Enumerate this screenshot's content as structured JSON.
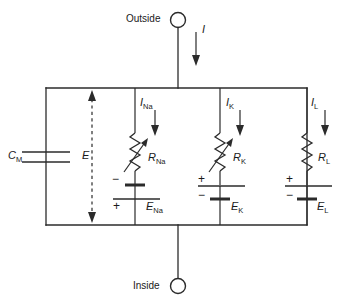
{
  "figure": {
    "title_outside": "Outside",
    "title_inside": "Inside",
    "type": "electrical-circuit-schematic"
  },
  "terminals": {
    "outside": {
      "label": "Outside",
      "icon": "circle-terminal"
    },
    "inside": {
      "label": "Inside",
      "icon": "circle-terminal"
    }
  },
  "currents": {
    "total": {
      "symbol": "I",
      "sub": ""
    },
    "sodium": {
      "symbol": "I",
      "sub": "Na"
    },
    "potassium": {
      "symbol": "I",
      "sub": "K"
    },
    "leak": {
      "symbol": "I",
      "sub": "L"
    }
  },
  "membrane_potential": {
    "symbol": "E",
    "sub": "",
    "arrow": "double-headed-dashed"
  },
  "capacitor": {
    "symbol": "C",
    "sub": "M",
    "name": "membrane-capacitance"
  },
  "branches": [
    {
      "name": "sodium-branch",
      "current": {
        "symbol": "I",
        "sub": "Na"
      },
      "resistor": {
        "symbol": "R",
        "sub": "Na",
        "variable": true
      },
      "battery": {
        "symbol": "E",
        "sub": "Na",
        "top_sign": "−",
        "bottom_sign": "+"
      }
    },
    {
      "name": "potassium-branch",
      "current": {
        "symbol": "I",
        "sub": "K"
      },
      "resistor": {
        "symbol": "R",
        "sub": "K",
        "variable": true
      },
      "battery": {
        "symbol": "E",
        "sub": "K",
        "top_sign": "+",
        "bottom_sign": "−"
      }
    },
    {
      "name": "leak-branch",
      "current": {
        "symbol": "I",
        "sub": "L"
      },
      "resistor": {
        "symbol": "R",
        "sub": "L",
        "variable": false
      },
      "battery": {
        "symbol": "E",
        "sub": "L",
        "top_sign": "+",
        "bottom_sign": "−"
      }
    }
  ],
  "colors": {
    "line": "#2b2b2b",
    "background": "#ffffff",
    "text": "#1a1a1a"
  }
}
